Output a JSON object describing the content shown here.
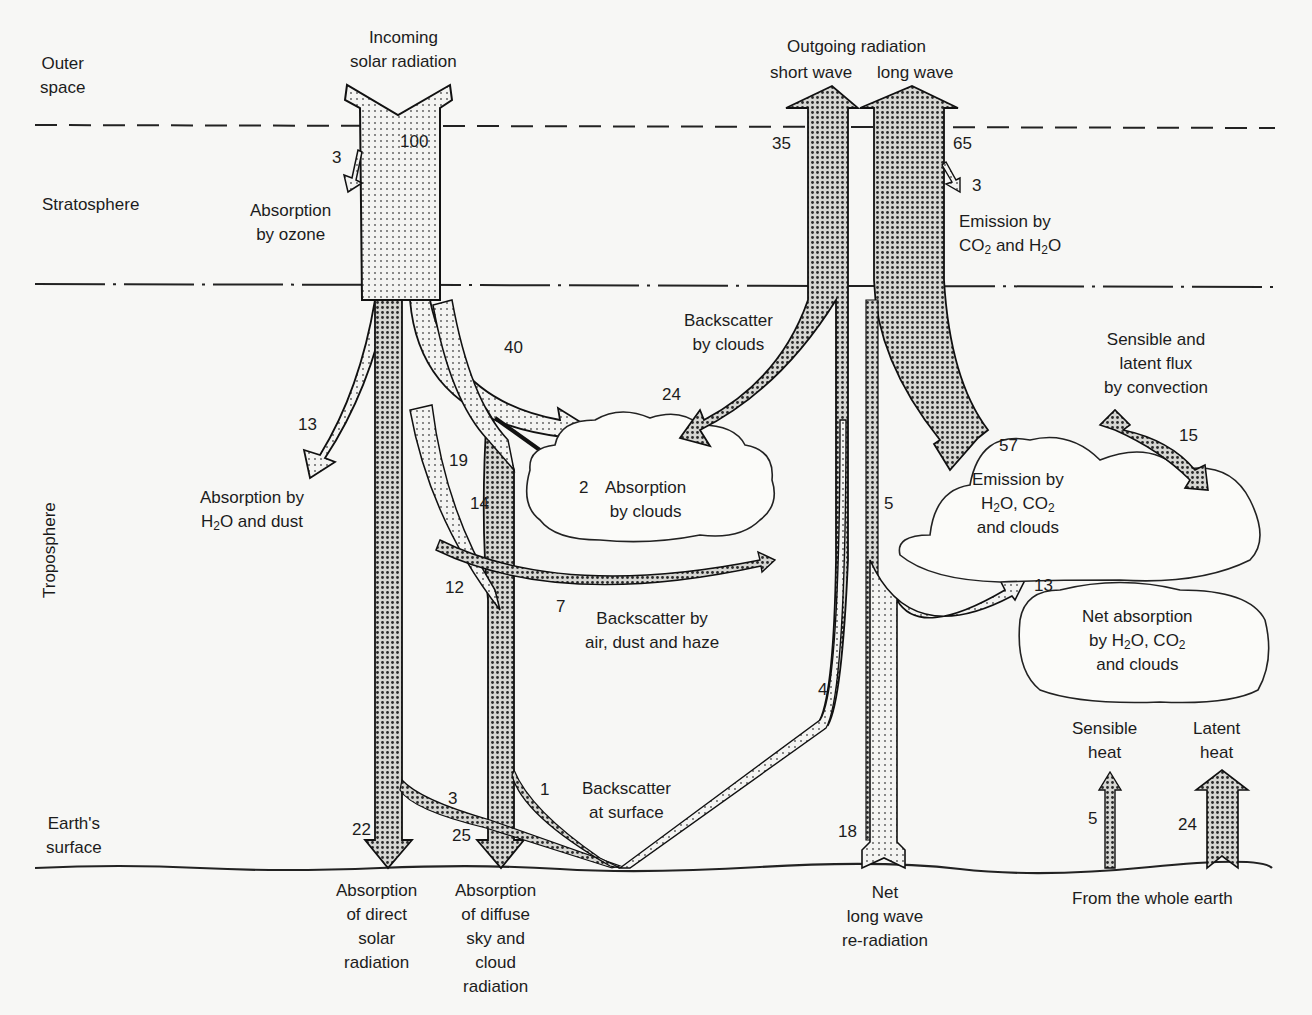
{
  "layers": {
    "outer_space": [
      "Outer",
      "space"
    ],
    "stratosphere": "Stratosphere",
    "troposphere": "Troposphere",
    "earth_surface": [
      "Earth's",
      "surface"
    ]
  },
  "incoming": {
    "label": [
      "Incoming",
      "solar radiation"
    ],
    "value": "100",
    "ozone_value": "3",
    "ozone_label": [
      "Absorption",
      "by ozone"
    ],
    "h2o_dust_value": "13",
    "h2o_dust_label": [
      "Absorption by",
      "H2O and dust"
    ],
    "clouds_value": "40",
    "cloud_absorb_value": "2",
    "cloud_absorb_label": [
      "Absorption",
      "by clouds"
    ],
    "backscatter_clouds_value": "24",
    "backscatter_clouds_label": [
      "Backscatter",
      "by clouds"
    ],
    "diffuse_19": "19",
    "diffuse_14": "14",
    "diffuse_12": "12",
    "air_backscatter_value": "7",
    "air_backscatter_label": [
      "Backscatter by",
      "air, dust and haze"
    ]
  },
  "surface": {
    "direct_value": "22",
    "direct_label": [
      "Absorption",
      "of direct",
      "solar",
      "radiation"
    ],
    "diffuse_value": "25",
    "diffuse_label": [
      "Absorption",
      "of diffuse",
      "sky and",
      "cloud",
      "radiation"
    ],
    "surface_backscatter_3": "3",
    "surface_backscatter_1": "1",
    "surface_backscatter_label": [
      "Backscatter",
      "at surface"
    ],
    "reflected_up_value": "4"
  },
  "outgoing": {
    "label": "Outgoing radiation",
    "short_wave": "short wave",
    "long_wave": "long wave",
    "short_value": "35",
    "long_value": "65",
    "co2_h2o_value": "3",
    "co2_h2o_label": [
      "Emission by",
      "CO2 and H2O"
    ]
  },
  "longwave": {
    "to_space_value": "5",
    "net_reradiation_value": "18",
    "net_reradiation_label": [
      "Net",
      "long wave",
      "re-radiation"
    ],
    "emission_value": "57",
    "emission_label": [
      "Emission by",
      "H2O, CO2",
      "and clouds"
    ],
    "net_absorption_value": "13",
    "net_absorption_label": [
      "Net absorption",
      "by H2O, CO2",
      "and clouds"
    ],
    "convection_value": "15",
    "convection_label": [
      "Sensible and",
      "latent flux",
      "by convection"
    ]
  },
  "heat": {
    "sensible_label": [
      "Sensible",
      "heat"
    ],
    "sensible_value": "5",
    "latent_label": [
      "Latent",
      "heat"
    ],
    "latent_value": "24",
    "whole_earth_label": "From the whole earth"
  },
  "colors": {
    "ink": "#1c1c1c",
    "paper": "#f7f7f5",
    "light_stipple": "#d9d9d6",
    "dark_stipple": "#a8a8a4"
  }
}
